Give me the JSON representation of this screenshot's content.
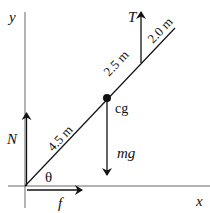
{
  "diagram": {
    "type": "free-body-diagram",
    "axes": {
      "x_label": "x",
      "y_label": "y"
    },
    "beam": {
      "segments": [
        {
          "label": "4.5 m",
          "description": "origin to cg"
        },
        {
          "label": "2.5 m",
          "description": "cg to tension point"
        },
        {
          "label": "2.0 m",
          "description": "tension point to top end"
        }
      ],
      "angle_label": "θ"
    },
    "point": {
      "label": "cg"
    },
    "forces": [
      {
        "name": "normal",
        "label": "N",
        "direction": "up"
      },
      {
        "name": "friction",
        "label": "f",
        "direction": "right"
      },
      {
        "name": "weight",
        "label": "mg",
        "direction": "down"
      },
      {
        "name": "tension",
        "label": "T",
        "direction": "up"
      }
    ],
    "colors": {
      "line": "#111111",
      "axis": "#555555",
      "background": "#ffffff"
    }
  }
}
